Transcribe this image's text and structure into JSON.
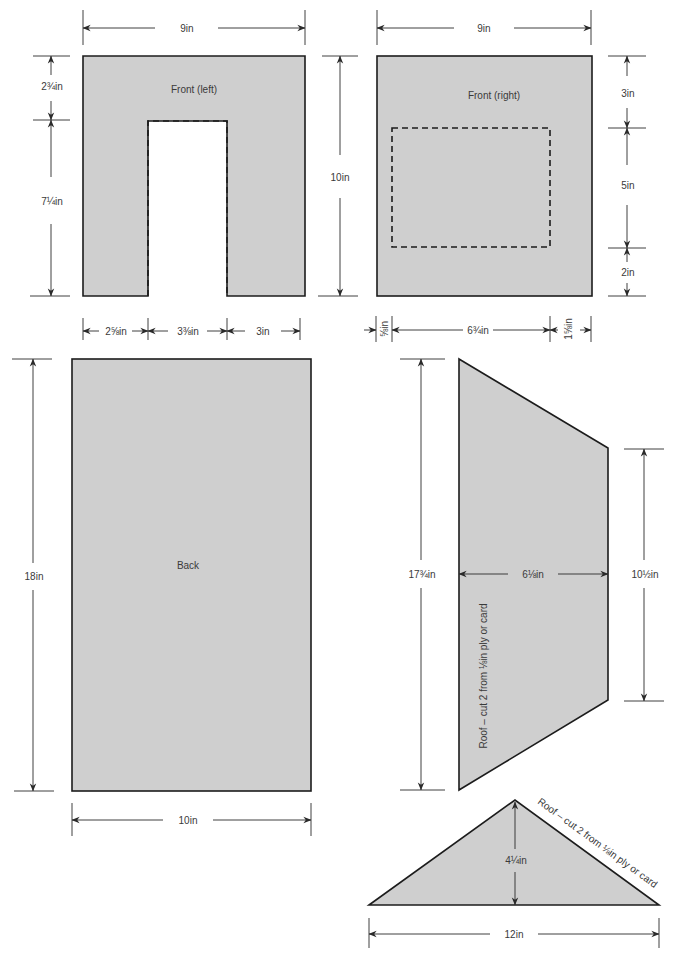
{
  "colors": {
    "piece_fill": "#cfcfcf",
    "outline": "#1c1c1c",
    "background": "#ffffff"
  },
  "pieces": {
    "front_left": {
      "label": "Front (left)",
      "width": "9in",
      "height": "10in",
      "top_section": "2¾in",
      "lower_section": "7¼in",
      "bottom_left": "2⅝in",
      "bottom_middle": "3⅜in",
      "bottom_right": "3in"
    },
    "front_right": {
      "label": "Front (right)",
      "width": "9in",
      "top_section": "3in",
      "middle_section": "5in",
      "bottom_section": "2in",
      "bottom_left": "⅝in",
      "bottom_middle": "6¾in",
      "bottom_right": "1⅝in"
    },
    "back": {
      "label": "Back",
      "height": "18in",
      "width": "10in"
    },
    "roof_side": {
      "label": "Roof – cut 2 from ⅛in ply or card",
      "left_height": "17¾in",
      "width": "6⅛in",
      "right_height": "10½in"
    },
    "roof_gable": {
      "label": "Roof – cut 2 from ⅛in ply or card",
      "height": "4¼in",
      "base": "12in"
    }
  }
}
